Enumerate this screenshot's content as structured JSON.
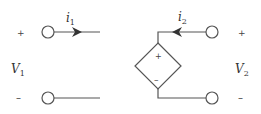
{
  "diagram": {
    "colors": {
      "wire": "#555555",
      "text": "#333333",
      "background": "#ffffff"
    },
    "port1": {
      "plus": "+",
      "minus": "–",
      "voltage_label": "V",
      "voltage_sub": "1",
      "current_label": "i",
      "current_sub": "1"
    },
    "port2": {
      "plus": "+",
      "minus": "–",
      "voltage_label": "V",
      "voltage_sub": "2",
      "current_label": "i",
      "current_sub": "2"
    },
    "dependent_source": {
      "shape": "diamond",
      "plus": "+",
      "minus": "–"
    }
  }
}
